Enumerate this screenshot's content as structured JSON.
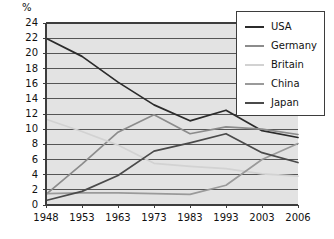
{
  "chart_data": {
    "type": "line",
    "title": "",
    "subtitle": "",
    "xlabel": "",
    "ylabel": "%",
    "unit_label": "%",
    "x": [
      1948,
      1953,
      1963,
      1973,
      1983,
      1993,
      2003,
      2006
    ],
    "categories": [
      "1948",
      "1953",
      "1963",
      "1973",
      "1983",
      "1993",
      "2003",
      "2006"
    ],
    "xlim": [
      1948,
      2006
    ],
    "ylim": [
      0,
      24
    ],
    "ytick_step": 2,
    "yticks": [
      0,
      2,
      4,
      6,
      8,
      10,
      12,
      14,
      16,
      18,
      20,
      22,
      24
    ],
    "ytick_labels": [
      "0",
      "2",
      "4",
      "6",
      "8",
      "10",
      "12",
      "14",
      "16",
      "18",
      "20",
      "22",
      "24"
    ],
    "grid": true,
    "grid_axis": "y",
    "legend_position": "top-right",
    "plot_background": "#e3e3e3",
    "grid_color": "#555555",
    "axis_color": "#3d3d3d",
    "series": [
      {
        "name": "USA",
        "color": "#2b2b2b",
        "values": [
          22.0,
          19.6,
          16.2,
          13.2,
          11.1,
          12.5,
          9.8,
          8.9
        ]
      },
      {
        "name": "Germany",
        "color": "#8c8c8c",
        "values": [
          1.4,
          5.4,
          9.6,
          11.9,
          9.4,
          10.3,
          10.0,
          9.3
        ]
      },
      {
        "name": "Britain",
        "color": "#d2d2d2",
        "values": [
          11.3,
          9.7,
          7.9,
          5.5,
          5.1,
          4.8,
          4.1,
          3.8
        ]
      },
      {
        "name": "China",
        "color": "#9a9a9a",
        "values": [
          1.5,
          1.6,
          1.6,
          1.5,
          1.4,
          2.6,
          6.0,
          8.1
        ]
      },
      {
        "name": "Japan",
        "color": "#4a4a4a",
        "values": [
          0.6,
          1.8,
          3.9,
          7.1,
          8.2,
          9.4,
          6.9,
          5.6
        ]
      }
    ]
  },
  "legend": {
    "entries": [
      {
        "label": "USA",
        "color": "#2b2b2b"
      },
      {
        "label": "Germany",
        "color": "#8c8c8c"
      },
      {
        "label": "Britain",
        "color": "#d2d2d2"
      },
      {
        "label": "China",
        "color": "#9a9a9a"
      },
      {
        "label": "Japan",
        "color": "#4a4a4a"
      }
    ]
  }
}
